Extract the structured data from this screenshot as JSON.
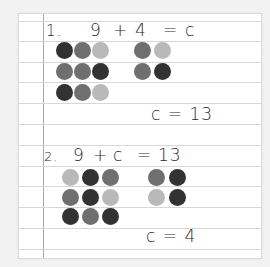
{
  "colors": {
    "dark": "#323232",
    "medium": "#6f6f6f",
    "light": "#b9b9b9"
  },
  "problems": [
    {
      "number": "1.",
      "equation": {
        "a": "9",
        "op": "+",
        "b": "4",
        "eq": "=",
        "result": "c"
      },
      "answer": "c = 13",
      "group_left": [
        [
          "dark",
          "medium",
          "light"
        ],
        [
          "medium",
          "medium",
          "dark"
        ],
        [
          "dark",
          "medium",
          "light"
        ]
      ],
      "group_right": [
        [
          "medium",
          "light"
        ],
        [
          "medium",
          "dark"
        ]
      ]
    },
    {
      "number": "2.",
      "equation": {
        "a": "9",
        "op": "+",
        "b": "c",
        "eq": "=",
        "result": "13"
      },
      "answer": "c = 4",
      "group_left": [
        [
          "light",
          "dark",
          "medium"
        ],
        [
          "medium",
          "dark",
          "light"
        ],
        [
          "dark",
          "medium",
          "dark"
        ]
      ],
      "group_right": [
        [
          "medium",
          "dark"
        ],
        [
          "light",
          "dark"
        ]
      ]
    }
  ]
}
